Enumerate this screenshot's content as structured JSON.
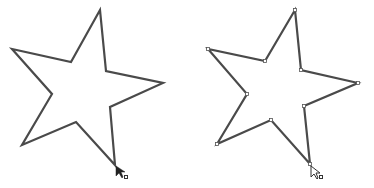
{
  "canvas": {
    "width": 374,
    "height": 188,
    "background": "#ffffff"
  },
  "stroke_color": "#4a4a4a",
  "anchor_fill": "#ffffff",
  "left_star": {
    "points": "100,10 71,62 12,49 52,94 22,145 76,122 115,165 110,107 163,83 106,71",
    "anchors_shown": false,
    "cursor": {
      "type": "direct-selection-arrow-filled",
      "x": 116,
      "y": 167
    }
  },
  "right_star": {
    "points": "295,10 265,61 208,49 247,94 217,144 271,120 310,164 304,106 358,83 301,70",
    "anchors_shown": true,
    "cursor": {
      "type": "direct-selection-arrow-hollow",
      "x": 311,
      "y": 166
    }
  }
}
